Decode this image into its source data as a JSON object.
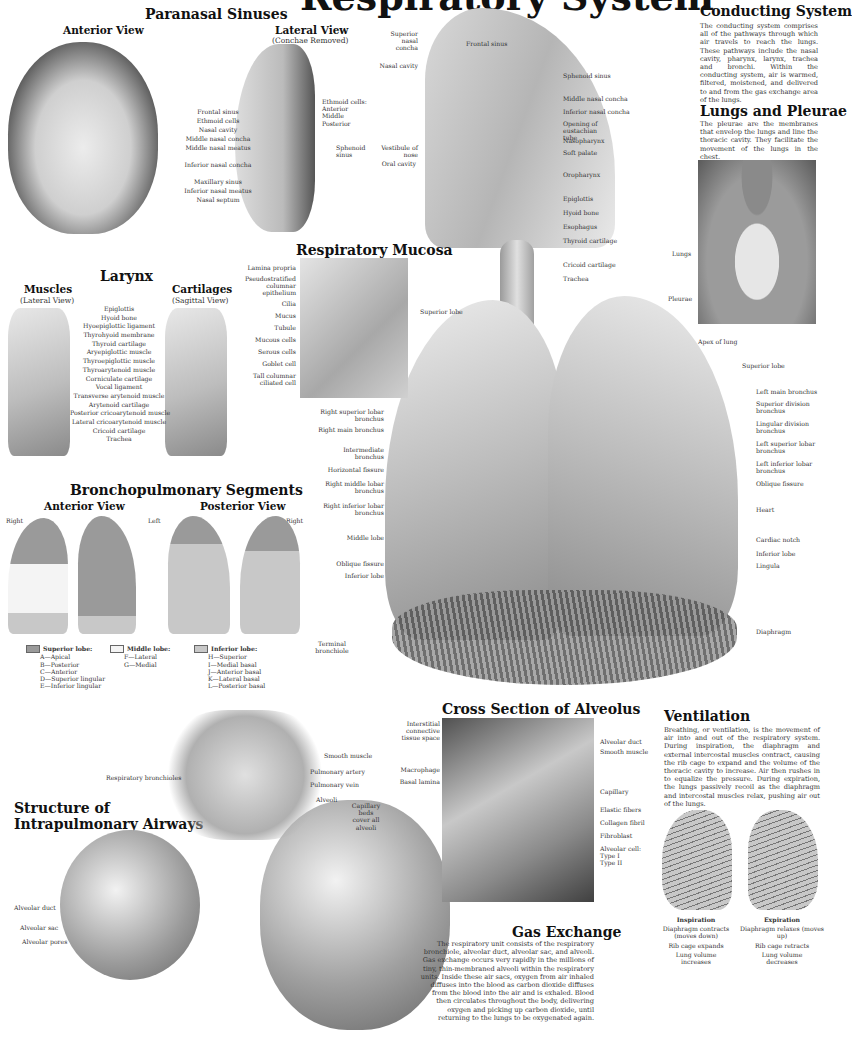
{
  "title": "Respiratory System",
  "paranasal": {
    "title": "Paranasal Sinuses",
    "anterior_title": "Anterior View",
    "lateral_title": "Lateral View",
    "lateral_note": "(Conchae Removed)",
    "labels": [
      "Frontal sinus",
      "Ethmoid cells",
      "Nasal cavity",
      "Middle nasal concha",
      "Middle nasal meatus",
      "Inferior nasal concha",
      "Maxillary sinus",
      "Inferior nasal meatus",
      "Nasal septum"
    ],
    "lateral_labels": [
      "Ethmoid cells:",
      "Anterior",
      "Middle",
      "Posterior",
      "Sphenoid sinus"
    ]
  },
  "head_section": {
    "left_labels": [
      "Superior nasal concha",
      "Nasal cavity",
      "Vestibule of nose",
      "Oral cavity"
    ],
    "right_labels": [
      "Frontal sinus",
      "Sphenoid sinus",
      "Middle nasal concha",
      "Inferior nasal concha",
      "Opening of eustachian tube",
      "Nasopharynx",
      "Soft palate",
      "Oropharynx",
      "Epiglottis",
      "Hyoid bone",
      "Esophagus",
      "Thyroid cartilage",
      "Cricoid cartilage",
      "Trachea"
    ]
  },
  "conducting": {
    "title": "Conducting System",
    "text": "The conducting system comprises all of the pathways through which air travels to reach the lungs. These pathways include the nasal cavity, pharynx, larynx, trachea and bronchi. Within the conducting system, air is warmed, filtered, moistened, and delivered to and from the gas exchange area of the lungs."
  },
  "pleurae": {
    "title": "Lungs and Pleurae",
    "text": "The pleurae are the membranes that envelop the lungs and line the thoracic cavity. They facilitate the movement of the lungs in the chest.",
    "labels": [
      "Lungs",
      "Pleurae"
    ]
  },
  "larynx": {
    "title": "Larynx",
    "muscles_title": "Muscles",
    "muscles_note": "(Lateral View)",
    "cartilages_title": "Cartilages",
    "cartilages_note": "(Sagittal View)",
    "labels": [
      "Epiglottis",
      "Hyoid bone",
      "Hyoepiglottic ligament",
      "Thyrohyoid membrane",
      "Thyroid cartilage",
      "Aryepiglottic muscle",
      "Thyroepiglottic muscle",
      "Thyroarytenoid muscle",
      "Corniculate cartilage",
      "Vocal ligament",
      "Transverse arytenoid muscle",
      "Arytenoid cartilage",
      "Posterior cricoarytenoid muscle",
      "Lateral cricoarytenoid muscle",
      "Cricoid cartilage",
      "Trachea"
    ]
  },
  "mucosa": {
    "title": "Respiratory Mucosa",
    "labels": [
      "Lamina propria",
      "Pseudostratified columnar epithelium",
      "Cilia",
      "Mucus",
      "Tubule",
      "Mucous cells",
      "Serous cells",
      "Goblet cell",
      "Tall columnar ciliated cell"
    ]
  },
  "lungs": {
    "left_labels": [
      "Superior lobe",
      "Right superior lobar bronchus",
      "Right main bronchus",
      "Intermediate bronchus",
      "Horizontal fissure",
      "Right middle lobar bronchus",
      "Right inferior lobar bronchus",
      "Middle lobe",
      "Oblique fissure",
      "Inferior lobe"
    ],
    "right_labels": [
      "Apex of lung",
      "Superior lobe",
      "Left main bronchus",
      "Superior division bronchus",
      "Lingular division bronchus",
      "Left superior lobar bronchus",
      "Left inferior lobar bronchus",
      "Oblique fissure",
      "Heart",
      "Cardiac notch",
      "Inferior lobe",
      "Lingula",
      "Diaphragm"
    ],
    "terminal": "Terminal bronchiole"
  },
  "segments": {
    "title": "Bronchopulmonary Segments",
    "anterior_title": "Anterior View",
    "posterior_title": "Posterior View",
    "side_labels": [
      "Right",
      "Left",
      "Right"
    ],
    "legend": [
      {
        "title": "Superior lobe:",
        "items": [
          "A—Apical",
          "B—Posterior",
          "C—Anterior",
          "D—Superior lingular",
          "E—Inferior lingular"
        ],
        "color": "#9a9a9a"
      },
      {
        "title": "Middle lobe:",
        "items": [
          "F—Lateral",
          "G—Medial"
        ],
        "color": "#f4f4f4"
      },
      {
        "title": "Inferior lobe:",
        "items": [
          "H—Superior",
          "I—Medial basal",
          "J—Anterior basal",
          "K—Lateral basal",
          "L—Posterior basal"
        ],
        "color": "#c8c8c8"
      }
    ]
  },
  "airways": {
    "title_line1": "Structure of",
    "title_line2": "Intrapulmonary Airways",
    "labels": [
      "Smooth muscle",
      "Pulmonary artery",
      "Pulmonary vein",
      "Respiratory bronchioles",
      "Alveoli",
      "Capillary beds cover all alveoli",
      "Alveolar duct",
      "Alveolar sac",
      "Alveolar pores"
    ]
  },
  "alveolus": {
    "title": "Cross Section of Alveolus",
    "left_labels": [
      "Interstitial connective tissue space",
      "Macrophage",
      "Basal lamina"
    ],
    "right_labels": [
      "Alveolar duct",
      "Smooth muscle",
      "Capillary",
      "Elastic fibers",
      "Collagen fibril",
      "Fibroblast",
      "Alveolar cell:",
      "Type I",
      "Type II"
    ]
  },
  "gas": {
    "title": "Gas Exchange",
    "text": "The respiratory unit consists of the respiratory bronchiole, alveolar duct, alveolar sac, and alveoli. Gas exchange occurs very rapidly in the millions of tiny, thin-membraned alveoli within the respiratory units. Inside these air sacs, oxygen from air inhaled diffuses into the blood as carbon dioxide diffuses from the blood into the air and is exhaled. Blood then circulates throughout the body, delivering oxygen and picking up carbon dioxide, until returning to the lungs to be oxygenated again."
  },
  "ventilation": {
    "title": "Ventilation",
    "text": "Breathing, or ventilation, is the movement of air into and out of the respiratory system. During inspiration, the diaphragm and external intercostal muscles contract, causing the rib cage to expand and the volume of the thoracic cavity to increase. Air then rushes in to equalize the pressure. During expiration, the lungs passively recoil as the diaphragm and intercostal muscles relax, pushing air out of the lungs.",
    "inspiration": {
      "title": "Inspiration",
      "lines": [
        "Diaphragm contracts (moves down)",
        "Rib cage expands",
        "Lung volume increases"
      ]
    },
    "expiration": {
      "title": "Expiration",
      "lines": [
        "Diaphragm relaxes (moves up)",
        "Rib cage retracts",
        "Lung volume decreases"
      ]
    }
  }
}
